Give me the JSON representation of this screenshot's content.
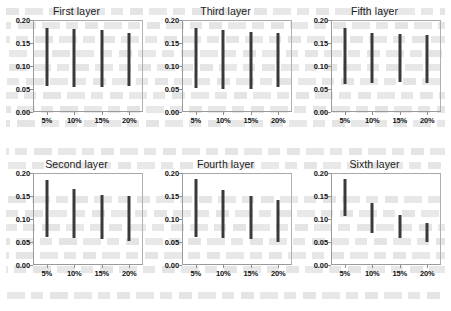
{
  "figure": {
    "background_color": "#ffffff",
    "bar_color": "#3a3a3a",
    "axis_color": "#9a9a9a",
    "panel_order": [
      "first",
      "third",
      "fifth",
      "second",
      "fourth",
      "sixth"
    ]
  },
  "axes": {
    "y_ticks": [
      "0.00",
      "0.05",
      "0.10",
      "0.15",
      "0.20"
    ],
    "y_tick_values": [
      0.0,
      0.05,
      0.1,
      0.15,
      0.2
    ],
    "x_ticks": [
      "5%",
      "10%",
      "15%",
      "20%"
    ],
    "ylim": [
      0.0,
      0.2
    ],
    "grid": "off",
    "legend": "none"
  },
  "chart_data": [
    {
      "type": "bar",
      "id": "first",
      "title": "First layer",
      "xlabel": "",
      "ylabel": "",
      "categories": [
        "5%",
        "10%",
        "15%",
        "20%"
      ],
      "ylim": [
        0.0,
        0.2
      ],
      "bar_style": "floating-range",
      "low": [
        0.057,
        0.055,
        0.055,
        0.057
      ],
      "high": [
        0.183,
        0.18,
        0.178,
        0.172
      ],
      "values": [
        0.126,
        0.125,
        0.123,
        0.115
      ]
    },
    {
      "type": "bar",
      "id": "third",
      "title": "Third layer",
      "xlabel": "",
      "ylabel": "",
      "categories": [
        "5%",
        "10%",
        "15%",
        "20%"
      ],
      "ylim": [
        0.0,
        0.2
      ],
      "bar_style": "floating-range",
      "low": [
        0.053,
        0.05,
        0.05,
        0.055
      ],
      "high": [
        0.183,
        0.178,
        0.175,
        0.172
      ],
      "values": [
        0.13,
        0.128,
        0.125,
        0.117
      ]
    },
    {
      "type": "bar",
      "id": "fifth",
      "title": "Fifth layer",
      "xlabel": "",
      "ylabel": "",
      "categories": [
        "5%",
        "10%",
        "15%",
        "20%"
      ],
      "ylim": [
        0.0,
        0.2
      ],
      "bar_style": "floating-range",
      "low": [
        0.06,
        0.063,
        0.065,
        0.063
      ],
      "high": [
        0.183,
        0.172,
        0.17,
        0.168
      ],
      "values": [
        0.123,
        0.109,
        0.105,
        0.105
      ]
    },
    {
      "type": "bar",
      "id": "second",
      "title": "Second layer",
      "xlabel": "",
      "ylabel": "",
      "categories": [
        "5%",
        "10%",
        "15%",
        "20%"
      ],
      "ylim": [
        0.0,
        0.2
      ],
      "bar_style": "floating-range",
      "low": [
        0.06,
        0.058,
        0.055,
        0.052
      ],
      "high": [
        0.183,
        0.165,
        0.152,
        0.148
      ],
      "values": [
        0.123,
        0.107,
        0.097,
        0.096
      ]
    },
    {
      "type": "bar",
      "id": "fourth",
      "title": "Fourth layer",
      "xlabel": "",
      "ylabel": "",
      "categories": [
        "5%",
        "10%",
        "15%",
        "20%"
      ],
      "ylim": [
        0.0,
        0.2
      ],
      "bar_style": "floating-range",
      "low": [
        0.06,
        0.058,
        0.055,
        0.05
      ],
      "high": [
        0.185,
        0.163,
        0.15,
        0.14
      ],
      "values": [
        0.125,
        0.105,
        0.095,
        0.09
      ]
    },
    {
      "type": "bar",
      "id": "sixth",
      "title": "Sixth layer",
      "xlabel": "",
      "ylabel": "",
      "categories": [
        "5%",
        "10%",
        "15%",
        "20%"
      ],
      "ylim": [
        0.0,
        0.2
      ],
      "bar_style": "floating-range",
      "low": [
        0.105,
        0.068,
        0.058,
        0.05
      ],
      "high": [
        0.185,
        0.133,
        0.108,
        0.09
      ],
      "values": [
        0.08,
        0.065,
        0.05,
        0.04
      ]
    }
  ]
}
